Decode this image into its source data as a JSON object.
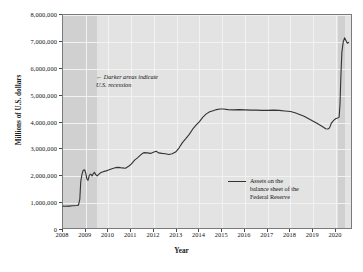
{
  "chart_data": {
    "type": "line",
    "title": "",
    "xlabel": "Year",
    "ylabel": "Millions of U.S. dollars",
    "xlim": [
      2008,
      2020.75
    ],
    "ylim": [
      0,
      8000000
    ],
    "grid": true,
    "legend_position": "inside-right",
    "ytick_labels": [
      "0",
      "1,000,000",
      "2,000,000",
      "3,000,000",
      "4,000,000",
      "5,000,000",
      "6,000,000",
      "7,000,000",
      "8,000,000"
    ],
    "ytick_values": [
      0,
      1000000,
      2000000,
      3000000,
      4000000,
      5000000,
      6000000,
      7000000,
      8000000
    ],
    "xtick_labels": [
      "2008",
      "2009",
      "2010",
      "2011",
      "2012",
      "2013",
      "2014",
      "2015",
      "2016",
      "2017",
      "2018",
      "2019",
      "2020"
    ],
    "xtick_values": [
      2008,
      2009,
      2010,
      2011,
      2012,
      2013,
      2014,
      2015,
      2016,
      2017,
      2018,
      2019,
      2020
    ],
    "series": [
      {
        "name": "Assets on the balance sheet of the Federal Reserve",
        "color": "#333333",
        "points": [
          [
            2008.0,
            890000
          ],
          [
            2008.1,
            885000
          ],
          [
            2008.2,
            895000
          ],
          [
            2008.3,
            890000
          ],
          [
            2008.4,
            900000
          ],
          [
            2008.5,
            905000
          ],
          [
            2008.6,
            910000
          ],
          [
            2008.68,
            925000
          ],
          [
            2008.74,
            1150000
          ],
          [
            2008.78,
            1800000
          ],
          [
            2008.83,
            2050000
          ],
          [
            2008.88,
            2210000
          ],
          [
            2008.95,
            2240000
          ],
          [
            2009.0,
            2120000
          ],
          [
            2009.05,
            1900000
          ],
          [
            2009.1,
            1850000
          ],
          [
            2009.16,
            2040000
          ],
          [
            2009.22,
            2080000
          ],
          [
            2009.28,
            2010000
          ],
          [
            2009.33,
            2090000
          ],
          [
            2009.38,
            2150000
          ],
          [
            2009.44,
            2060000
          ],
          [
            2009.5,
            2010000
          ],
          [
            2009.56,
            2060000
          ],
          [
            2009.62,
            2110000
          ],
          [
            2009.7,
            2150000
          ],
          [
            2009.8,
            2180000
          ],
          [
            2009.9,
            2200000
          ],
          [
            2010.0,
            2230000
          ],
          [
            2010.15,
            2280000
          ],
          [
            2010.3,
            2320000
          ],
          [
            2010.45,
            2330000
          ],
          [
            2010.6,
            2310000
          ],
          [
            2010.75,
            2300000
          ],
          [
            2010.9,
            2380000
          ],
          [
            2011.0,
            2450000
          ],
          [
            2011.15,
            2600000
          ],
          [
            2011.3,
            2700000
          ],
          [
            2011.45,
            2820000
          ],
          [
            2011.55,
            2880000
          ],
          [
            2011.7,
            2870000
          ],
          [
            2011.85,
            2850000
          ],
          [
            2012.0,
            2900000
          ],
          [
            2012.1,
            2930000
          ],
          [
            2012.2,
            2870000
          ],
          [
            2012.35,
            2850000
          ],
          [
            2012.5,
            2840000
          ],
          [
            2012.65,
            2810000
          ],
          [
            2012.8,
            2840000
          ],
          [
            2012.95,
            2900000
          ],
          [
            2013.1,
            3050000
          ],
          [
            2013.25,
            3250000
          ],
          [
            2013.4,
            3400000
          ],
          [
            2013.55,
            3560000
          ],
          [
            2013.7,
            3750000
          ],
          [
            2013.85,
            3900000
          ],
          [
            2014.0,
            4030000
          ],
          [
            2014.15,
            4200000
          ],
          [
            2014.3,
            4320000
          ],
          [
            2014.45,
            4400000
          ],
          [
            2014.6,
            4440000
          ],
          [
            2014.75,
            4480000
          ],
          [
            2014.9,
            4500000
          ],
          [
            2015.05,
            4500000
          ],
          [
            2015.25,
            4480000
          ],
          [
            2015.5,
            4470000
          ],
          [
            2015.75,
            4480000
          ],
          [
            2016.0,
            4470000
          ],
          [
            2016.25,
            4460000
          ],
          [
            2016.5,
            4460000
          ],
          [
            2016.75,
            4450000
          ],
          [
            2017.0,
            4450000
          ],
          [
            2017.25,
            4460000
          ],
          [
            2017.5,
            4450000
          ],
          [
            2017.75,
            4430000
          ],
          [
            2018.0,
            4410000
          ],
          [
            2018.2,
            4360000
          ],
          [
            2018.4,
            4300000
          ],
          [
            2018.6,
            4230000
          ],
          [
            2018.8,
            4140000
          ],
          [
            2019.0,
            4050000
          ],
          [
            2019.2,
            3950000
          ],
          [
            2019.4,
            3850000
          ],
          [
            2019.55,
            3770000
          ],
          [
            2019.65,
            3760000
          ],
          [
            2019.72,
            3800000
          ],
          [
            2019.8,
            3980000
          ],
          [
            2019.9,
            4080000
          ],
          [
            2020.0,
            4150000
          ],
          [
            2020.08,
            4170000
          ],
          [
            2020.14,
            4200000
          ],
          [
            2020.18,
            4700000
          ],
          [
            2020.22,
            5800000
          ],
          [
            2020.26,
            6600000
          ],
          [
            2020.32,
            7000000
          ],
          [
            2020.38,
            7150000
          ],
          [
            2020.44,
            7050000
          ],
          [
            2020.5,
            6950000
          ],
          [
            2020.56,
            6980000
          ]
        ]
      }
    ],
    "recession_bands": [
      {
        "start": 2008.0,
        "end": 2009.5,
        "label": "U.S. recession"
      },
      {
        "start": 2020.08,
        "end": 2020.42,
        "label": "U.S. recession"
      }
    ],
    "annotations": [
      {
        "name": "recession-note",
        "text": "Darker areas indicate\nU.S. recession",
        "arrow": "←"
      }
    ]
  },
  "legend": {
    "entries": [
      {
        "label": "Assets on the\nbalance sheet of the\nFederal Reserve",
        "color": "#333333"
      }
    ]
  }
}
